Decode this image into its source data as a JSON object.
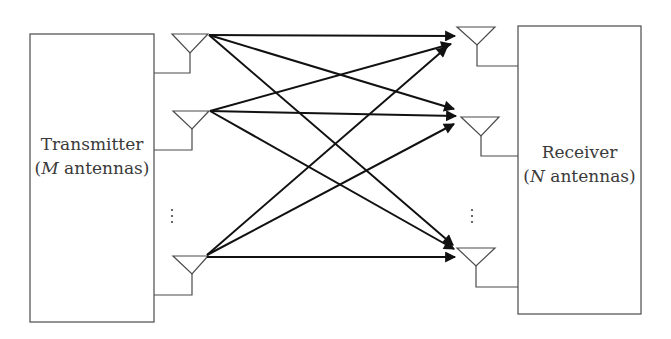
{
  "diagram": {
    "type": "MIMO system block diagram",
    "transmitter": {
      "label": "Transmitter",
      "sub_var": "M",
      "sub_rest": " antennas",
      "antenna_count_symbol": "M"
    },
    "receiver": {
      "label": "Receiver",
      "sub_var": "N",
      "sub_rest": " antennas",
      "antenna_count_symbol": "N"
    },
    "tx_antennas_shown": 3,
    "rx_antennas_shown": 3,
    "ellipsis": "⋮",
    "links": "every transmit antenna connects to every receive antenna (3×3 = 9 arrows shown)",
    "colors": {
      "line": "#3a3a3a",
      "arrow": "#111111",
      "background": "#ffffff"
    }
  }
}
